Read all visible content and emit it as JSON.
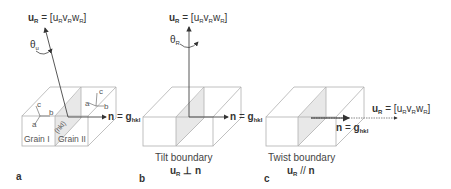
{
  "panels": [
    {
      "id": "a",
      "label": "a",
      "rotation_axis": {
        "main": "u",
        "main_sub": "R",
        "eq": " = [",
        "c1": "u",
        "s1": "R",
        "c2": "v",
        "s2": "R",
        "c3": "w",
        "s3": "R",
        "close": "]"
      },
      "angle": {
        "sym": "θ",
        "sub": "u"
      },
      "normal": {
        "n": "n",
        "eq": " = ",
        "g": "g",
        "g_sub": "hkl"
      },
      "grain1": "Grain I",
      "grain2": "Grain II",
      "plane_label": "(hkl)",
      "axes_grain1": {
        "a": "a",
        "b": "b",
        "c": "c"
      },
      "axes_grain2": {
        "a": "a",
        "b": "b",
        "c": "c"
      }
    },
    {
      "id": "b",
      "label": "b",
      "rotation_axis": {
        "main": "u",
        "main_sub": "R",
        "eq": " = [",
        "c1": "u",
        "s1": "R",
        "c2": "v",
        "s2": "R",
        "c3": "w",
        "s3": "R",
        "close": "]"
      },
      "angle": {
        "sym": "θ",
        "sub": "R"
      },
      "normal": {
        "n": "n",
        "eq": " = ",
        "g": "g",
        "g_sub": "hkl"
      },
      "caption": "Tilt boundary",
      "relation": {
        "u": "u",
        "u_sub": "R",
        "op": " ⊥ ",
        "n": "n"
      }
    },
    {
      "id": "c",
      "label": "c",
      "rotation_axis": {
        "main": "u",
        "main_sub": "R",
        "eq": " = [",
        "c1": "u",
        "s1": "R",
        "c2": "v",
        "s2": "R",
        "c3": "w",
        "s3": "R",
        "close": "]"
      },
      "normal": {
        "n": "n",
        "eq": " = ",
        "g": "g",
        "g_sub": "hkl"
      },
      "caption": "Twist boundary",
      "relation": {
        "u": "u",
        "u_sub": "R",
        "op": " // ",
        "n": "n"
      }
    }
  ],
  "colors": {
    "line": "#a8a8a8",
    "arrow": "#444444",
    "plane_fill": "#e6e6e6"
  }
}
